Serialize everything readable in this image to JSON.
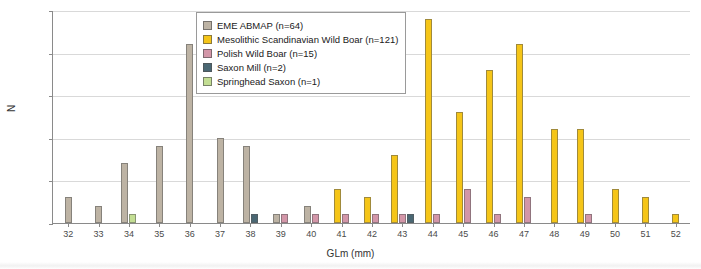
{
  "chart_data": {
    "type": "bar",
    "title": "",
    "xlabel": "GLm (mm)",
    "ylabel": "N",
    "ylim": [
      0,
      25
    ],
    "yticks": [
      0,
      5,
      10,
      15,
      20,
      25
    ],
    "grid": true,
    "legend_position": "top-center",
    "categories": [
      32,
      33,
      34,
      35,
      36,
      37,
      38,
      39,
      40,
      41,
      42,
      43,
      44,
      45,
      46,
      47,
      48,
      49,
      50,
      51,
      52
    ],
    "series": [
      {
        "name": "EME ABMAP (n=64)",
        "color": "#bdb3a4",
        "values": [
          3,
          2,
          7,
          9,
          21,
          10,
          9,
          1,
          2,
          0,
          0,
          0,
          0,
          0,
          0,
          0,
          0,
          0,
          0,
          0,
          0
        ]
      },
      {
        "name": "Mesolithic Scandinavian Wild Boar (n=121)",
        "color": "#f5c518",
        "values": [
          0,
          0,
          0,
          0,
          0,
          0,
          0,
          0,
          0,
          4,
          3,
          8,
          24,
          13,
          18,
          21,
          11,
          11,
          4,
          3,
          1
        ]
      },
      {
        "name": "Polish Wild Boar (n=15)",
        "color": "#d396a8",
        "values": [
          0,
          0,
          0,
          0,
          0,
          0,
          0,
          1,
          1,
          1,
          1,
          1,
          1,
          4,
          1,
          3,
          0,
          1,
          0,
          0,
          0
        ]
      },
      {
        "name": "Saxon Mill (n=2)",
        "color": "#4a6773",
        "values": [
          0,
          0,
          0,
          0,
          0,
          0,
          1,
          0,
          0,
          0,
          0,
          1,
          0,
          0,
          0,
          0,
          0,
          0,
          0,
          0,
          0
        ]
      },
      {
        "name": "Springhead Saxon (n=1)",
        "color": "#c3de93",
        "values": [
          0,
          0,
          1,
          0,
          0,
          0,
          0,
          0,
          0,
          0,
          0,
          0,
          0,
          0,
          0,
          0,
          0,
          0,
          0,
          0,
          0
        ]
      }
    ]
  },
  "legend": {
    "items": [
      {
        "label": "EME ABMAP (n=64)"
      },
      {
        "label": "Mesolithic Scandinavian Wild Boar (n=121)"
      },
      {
        "label": "Polish Wild Boar (n=15)"
      },
      {
        "label": "Saxon Mill (n=2)"
      },
      {
        "label": "Springhead Saxon (n=1)"
      }
    ]
  },
  "axes": {
    "y_title": "N",
    "x_title": "GLm (mm)"
  }
}
